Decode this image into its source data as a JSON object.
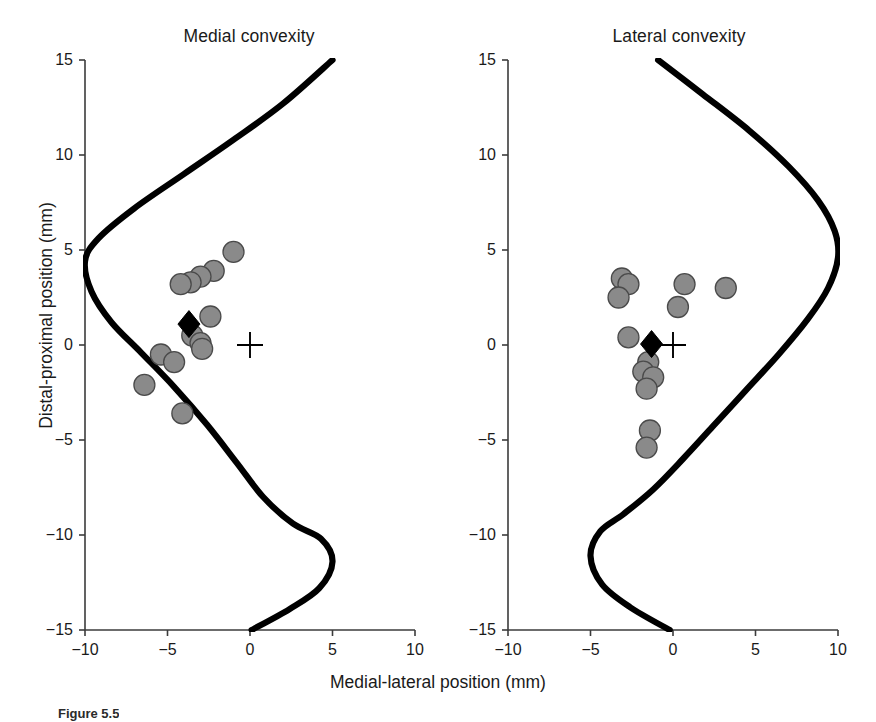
{
  "figure": {
    "caption_label": "Figure 5.5",
    "x_axis_label": "Medial-lateral position (mm)",
    "y_axis_label": "Distal-proximal position (mm)",
    "marker_colors": {
      "circle_fill": "#8a8a8a",
      "circle_stroke": "#4a4a4a",
      "mean_diamond": "#000000",
      "origin_cross": "#000000",
      "curve": "#000000",
      "axis": "#3c3c3c",
      "background": "#ffffff"
    }
  },
  "axes": {
    "x_ticks": [
      -10,
      -5,
      0,
      5,
      10
    ],
    "x_tick_labels": [
      "-10",
      "-5",
      "0",
      "5",
      "10"
    ],
    "y_ticks": [
      -15,
      -10,
      -5,
      0,
      5,
      10,
      15
    ],
    "y_tick_labels": [
      "-15",
      "-10",
      "-5",
      "0",
      "5",
      "10",
      "15"
    ],
    "xlim": [
      -10,
      10
    ],
    "ylim": [
      -15,
      15
    ],
    "grid": false
  },
  "chart_data": [
    {
      "type": "scatter",
      "title": "Medial convexity",
      "xlabel": "Medial-lateral position (mm)",
      "ylabel": "Distal-proximal position (mm)",
      "xlim": [
        -10,
        10
      ],
      "ylim": [
        -15,
        15
      ],
      "grid": false,
      "legend": "none",
      "series": [
        {
          "name": "Individual specimens",
          "marker": "circle",
          "color": "#8a8a8a",
          "points": [
            {
              "x": -1.0,
              "y": 4.9
            },
            {
              "x": -2.2,
              "y": 3.9
            },
            {
              "x": -3.0,
              "y": 3.6
            },
            {
              "x": -3.6,
              "y": 3.3
            },
            {
              "x": -4.2,
              "y": 3.2
            },
            {
              "x": -2.4,
              "y": 1.5
            },
            {
              "x": -3.5,
              "y": 0.5
            },
            {
              "x": -3.0,
              "y": 0.1
            },
            {
              "x": -2.9,
              "y": -0.2
            },
            {
              "x": -5.4,
              "y": -0.5
            },
            {
              "x": -4.6,
              "y": -0.9
            },
            {
              "x": -6.4,
              "y": -2.1
            },
            {
              "x": -4.1,
              "y": -3.6
            }
          ]
        },
        {
          "name": "Mean position",
          "marker": "diamond",
          "color": "#000000",
          "points": [
            {
              "x": -3.7,
              "y": 1.1
            }
          ]
        },
        {
          "name": "Origin reference",
          "marker": "cross",
          "color": "#000000",
          "points": [
            {
              "x": 0.0,
              "y": 0.0
            }
          ]
        }
      ],
      "curve": {
        "name": "Articular surface profile",
        "color": "#000000",
        "points": [
          {
            "x": 5.0,
            "y": 15.0
          },
          {
            "x": 2.0,
            "y": 12.7
          },
          {
            "x": -1.0,
            "y": 10.8
          },
          {
            "x": -4.0,
            "y": 9.0
          },
          {
            "x": -7.0,
            "y": 7.2
          },
          {
            "x": -9.2,
            "y": 5.6
          },
          {
            "x": -10.0,
            "y": 4.4
          },
          {
            "x": -9.6,
            "y": 2.8
          },
          {
            "x": -8.4,
            "y": 1.2
          },
          {
            "x": -6.6,
            "y": -0.4
          },
          {
            "x": -4.6,
            "y": -2.2
          },
          {
            "x": -2.6,
            "y": -4.2
          },
          {
            "x": -0.8,
            "y": -6.2
          },
          {
            "x": 0.8,
            "y": -8.0
          },
          {
            "x": 2.6,
            "y": -9.4
          },
          {
            "x": 4.3,
            "y": -10.2
          },
          {
            "x": 5.0,
            "y": -11.4
          },
          {
            "x": 4.2,
            "y": -12.8
          },
          {
            "x": 2.4,
            "y": -13.9
          },
          {
            "x": 0.1,
            "y": -15.0
          }
        ]
      }
    },
    {
      "type": "scatter",
      "title": "Lateral convexity",
      "xlabel": "Medial-lateral position (mm)",
      "ylabel": "Distal-proximal position (mm)",
      "xlim": [
        -10,
        10
      ],
      "ylim": [
        -15,
        15
      ],
      "grid": false,
      "legend": "none",
      "series": [
        {
          "name": "Individual specimens",
          "marker": "circle",
          "color": "#8a8a8a",
          "points": [
            {
              "x": -3.1,
              "y": 3.5
            },
            {
              "x": -2.7,
              "y": 3.2
            },
            {
              "x": 0.7,
              "y": 3.2
            },
            {
              "x": 3.2,
              "y": 3.0
            },
            {
              "x": -3.3,
              "y": 2.5
            },
            {
              "x": 0.3,
              "y": 2.0
            },
            {
              "x": -2.7,
              "y": 0.4
            },
            {
              "x": -1.5,
              "y": -0.9
            },
            {
              "x": -1.8,
              "y": -1.4
            },
            {
              "x": -1.2,
              "y": -1.7
            },
            {
              "x": -1.6,
              "y": -2.3
            },
            {
              "x": -1.4,
              "y": -4.5
            },
            {
              "x": -1.6,
              "y": -5.4
            }
          ]
        },
        {
          "name": "Mean position",
          "marker": "diamond",
          "color": "#000000",
          "points": [
            {
              "x": -1.3,
              "y": 0.05
            }
          ]
        },
        {
          "name": "Origin reference",
          "marker": "cross",
          "color": "#000000",
          "points": [
            {
              "x": 0.0,
              "y": 0.0
            }
          ]
        }
      ],
      "curve": {
        "name": "Articular surface profile",
        "color": "#000000",
        "points": [
          {
            "x": -0.9,
            "y": 15.0
          },
          {
            "x": 1.8,
            "y": 13.2
          },
          {
            "x": 4.6,
            "y": 11.3
          },
          {
            "x": 7.0,
            "y": 9.4
          },
          {
            "x": 8.8,
            "y": 7.6
          },
          {
            "x": 9.8,
            "y": 6.0
          },
          {
            "x": 10.0,
            "y": 4.6
          },
          {
            "x": 9.4,
            "y": 3.0
          },
          {
            "x": 8.2,
            "y": 1.4
          },
          {
            "x": 6.4,
            "y": -0.5
          },
          {
            "x": 4.4,
            "y": -2.4
          },
          {
            "x": 2.4,
            "y": -4.3
          },
          {
            "x": 0.6,
            "y": -6.0
          },
          {
            "x": -1.2,
            "y": -7.6
          },
          {
            "x": -3.0,
            "y": -8.9
          },
          {
            "x": -4.4,
            "y": -9.8
          },
          {
            "x": -5.0,
            "y": -11.1
          },
          {
            "x": -4.3,
            "y": -12.6
          },
          {
            "x": -2.6,
            "y": -13.8
          },
          {
            "x": -0.2,
            "y": -15.0
          }
        ]
      }
    }
  ]
}
